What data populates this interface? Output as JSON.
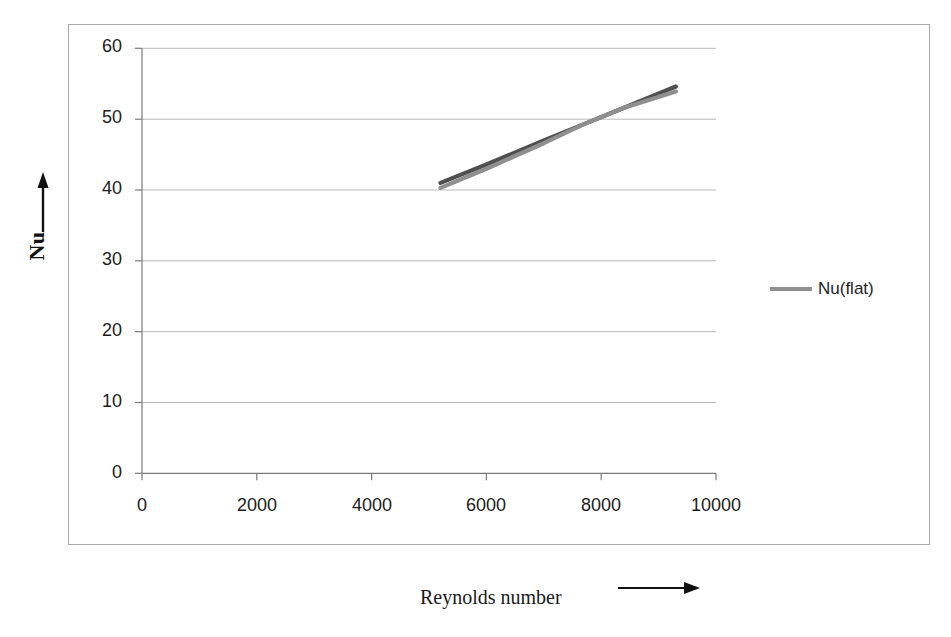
{
  "chart_data": {
    "type": "line",
    "title": "",
    "xlabel": "Reynolds number",
    "ylabel": "Nu",
    "xlim": [
      0,
      10000
    ],
    "ylim": [
      0,
      60
    ],
    "xticks": [
      0,
      2000,
      4000,
      6000,
      8000,
      10000
    ],
    "yticks": [
      0,
      10,
      20,
      30,
      40,
      50,
      60
    ],
    "xtick_labels": [
      "0",
      "2000",
      "4000",
      "6000",
      "8000",
      "10000"
    ],
    "ytick_labels": [
      "0",
      "10",
      "20",
      "30",
      "40",
      "50",
      "60"
    ],
    "grid": "horizontal",
    "legend_position": "right",
    "legend": [
      {
        "name": "Nu(flat)",
        "color": "#8f8f8f"
      }
    ],
    "series": [
      {
        "name": "series-dark",
        "color": "#4f4f4f",
        "x": [
          5200,
          6000,
          7000,
          7700,
          8400,
          9300
        ],
        "y": [
          41.0,
          43.6,
          47.0,
          49.3,
          51.6,
          54.6
        ]
      },
      {
        "name": "Nu(flat)",
        "color": "#8f8f8f",
        "x": [
          5200,
          6000,
          7000,
          7700,
          8400,
          9300
        ],
        "y": [
          40.3,
          43.0,
          46.6,
          49.3,
          51.6,
          53.9
        ]
      }
    ]
  },
  "axes": {
    "y_title": "Nu",
    "x_title": "Reynolds number",
    "y_arrow": "up-arrow",
    "x_arrow": "right-arrow"
  },
  "legend_panel": {
    "entries": [
      {
        "label": "Nu(flat)",
        "color": "#8f8f8f"
      }
    ]
  },
  "colors": {
    "frame": "#a8a8a8",
    "gridline": "#b9b9b9",
    "axis": "#6f6f6f",
    "text": "#1c1c1c",
    "series_dark": "#4f4f4f",
    "series_light": "#8f8f8f",
    "background": "#ffffff"
  }
}
